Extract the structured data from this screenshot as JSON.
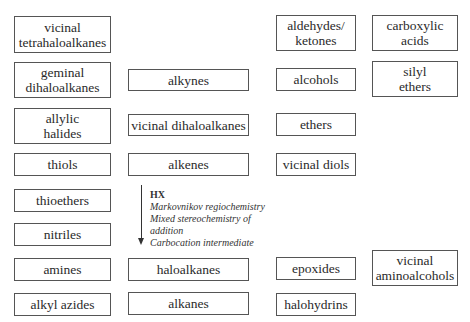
{
  "boxes": [
    {
      "id": "vicinal-tetrahaloalkanes",
      "label": "vicinal tetrahaloalkanes",
      "lines": [
        "vicinal",
        "tetrahaloalkanes"
      ],
      "x": 14,
      "y": 16,
      "w": 97,
      "h": 37
    },
    {
      "id": "geminal-dihaloalkanes",
      "label": "geminal dihaloalkanes",
      "lines": [
        "geminal",
        "dihaloalkanes"
      ],
      "x": 14,
      "y": 62,
      "w": 97,
      "h": 36
    },
    {
      "id": "allylic-halides",
      "label": "allylic halides",
      "lines": [
        "allylic",
        "halides"
      ],
      "x": 14,
      "y": 108,
      "w": 97,
      "h": 36
    },
    {
      "id": "thiols",
      "label": "thiols",
      "lines": [
        "thiols"
      ],
      "x": 14,
      "y": 153,
      "w": 97,
      "h": 23
    },
    {
      "id": "thioethers",
      "label": "thioethers",
      "lines": [
        "thioethers"
      ],
      "x": 14,
      "y": 189,
      "w": 97,
      "h": 23
    },
    {
      "id": "nitriles",
      "label": "nitriles",
      "lines": [
        "nitriles"
      ],
      "x": 14,
      "y": 223,
      "w": 97,
      "h": 23
    },
    {
      "id": "amines",
      "label": "amines",
      "lines": [
        "amines"
      ],
      "x": 14,
      "y": 258,
      "w": 97,
      "h": 23
    },
    {
      "id": "alkyl-azides",
      "label": "alkyl azides",
      "lines": [
        "alkyl azides"
      ],
      "x": 14,
      "y": 293,
      "w": 97,
      "h": 23
    },
    {
      "id": "alkynes",
      "label": "alkynes",
      "lines": [
        "alkynes"
      ],
      "x": 128,
      "y": 69,
      "w": 121,
      "h": 22
    },
    {
      "id": "vicinal-dihaloalkanes",
      "label": "vicinal dihaloalkanes",
      "lines": [
        "vicinal dihaloalkanes"
      ],
      "x": 128,
      "y": 114,
      "w": 121,
      "h": 22
    },
    {
      "id": "alkenes",
      "label": "alkenes",
      "lines": [
        "alkenes"
      ],
      "x": 128,
      "y": 153,
      "w": 121,
      "h": 23
    },
    {
      "id": "haloalkanes",
      "label": "haloalkanes",
      "lines": [
        "haloalkanes"
      ],
      "x": 128,
      "y": 258,
      "w": 121,
      "h": 23
    },
    {
      "id": "alkanes",
      "label": "alkanes",
      "lines": [
        "alkanes"
      ],
      "x": 128,
      "y": 292,
      "w": 121,
      "h": 23
    },
    {
      "id": "aldehydes-ketones",
      "label": "aldehydes/ ketones",
      "lines": [
        "aldehydes/",
        "ketones"
      ],
      "x": 276,
      "y": 15,
      "w": 80,
      "h": 36
    },
    {
      "id": "alcohols",
      "label": "alcohols",
      "lines": [
        "alcohols"
      ],
      "x": 276,
      "y": 68,
      "w": 80,
      "h": 23
    },
    {
      "id": "ethers",
      "label": "ethers",
      "lines": [
        "ethers"
      ],
      "x": 276,
      "y": 113,
      "w": 80,
      "h": 23
    },
    {
      "id": "vicinal-diols",
      "label": "vicinal diols",
      "lines": [
        "vicinal diols"
      ],
      "x": 276,
      "y": 153,
      "w": 80,
      "h": 23
    },
    {
      "id": "epoxides",
      "label": "epoxides",
      "lines": [
        "epoxides"
      ],
      "x": 276,
      "y": 257,
      "w": 80,
      "h": 23
    },
    {
      "id": "halohydrins",
      "label": "halohydrins",
      "lines": [
        "halohydrins"
      ],
      "x": 276,
      "y": 293,
      "w": 80,
      "h": 23
    },
    {
      "id": "carboxylic-acids",
      "label": "carboxylic acids",
      "lines": [
        "carboxylic",
        "acids"
      ],
      "x": 372,
      "y": 15,
      "w": 86,
      "h": 36
    },
    {
      "id": "silyl-ethers",
      "label": "silyl ethers",
      "lines": [
        "silyl",
        "ethers"
      ],
      "x": 372,
      "y": 61,
      "w": 86,
      "h": 36
    },
    {
      "id": "vicinal-aminoalcohols",
      "label": "vicinal aminoalcohols",
      "lines": [
        "vicinal",
        "aminoalcohols"
      ],
      "x": 372,
      "y": 250,
      "w": 86,
      "h": 36
    }
  ],
  "reaction": {
    "from": "alkenes",
    "to": "haloalkanes",
    "reagent": "HX",
    "notes": [
      "Markovnikov regiochemistry",
      "Mixed stereochemistry of",
      "addition",
      "Carbocation intermediate"
    ]
  }
}
